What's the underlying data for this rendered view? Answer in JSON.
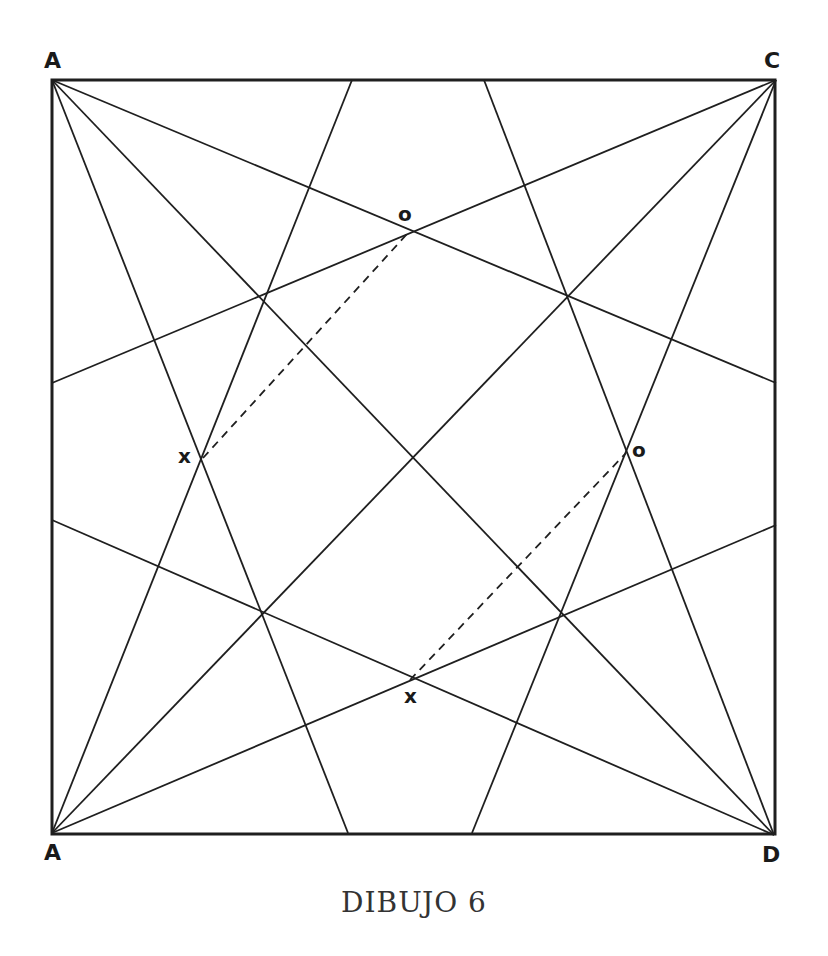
{
  "figure": {
    "caption": "DIBUJO 6",
    "line_color": "#1f1f1f",
    "background": "#ffffff"
  },
  "vertices": {
    "top_left": {
      "label": "A",
      "x": 52,
      "y": 80
    },
    "top_right": {
      "label": "C",
      "x": 776,
      "y": 80
    },
    "bottom_left": {
      "label": "A",
      "x": 52,
      "y": 833
    },
    "bottom_right": {
      "label": "D",
      "x": 774,
      "y": 835
    }
  },
  "points": [
    {
      "label": "o",
      "x": 407,
      "y": 234
    },
    {
      "label": "x",
      "x": 203,
      "y": 458
    },
    {
      "label": "o",
      "x": 626,
      "y": 453
    },
    {
      "label": "x",
      "x": 410,
      "y": 680
    }
  ],
  "lines": [
    {
      "from": [
        52,
        80
      ],
      "to": [
        774,
        835
      ]
    },
    {
      "from": [
        776,
        80
      ],
      "to": [
        52,
        833
      ]
    },
    {
      "from": [
        52,
        80
      ],
      "to": [
        776,
        383
      ]
    },
    {
      "from": [
        52,
        80
      ],
      "to": [
        348,
        833
      ]
    },
    {
      "from": [
        776,
        80
      ],
      "to": [
        52,
        383
      ]
    },
    {
      "from": [
        776,
        80
      ],
      "to": [
        472,
        833
      ]
    },
    {
      "from": [
        52,
        833
      ],
      "to": [
        352,
        80
      ]
    },
    {
      "from": [
        52,
        833
      ],
      "to": [
        776,
        525
      ]
    },
    {
      "from": [
        774,
        835
      ],
      "to": [
        52,
        520
      ]
    },
    {
      "from": [
        774,
        835
      ],
      "to": [
        484,
        80
      ]
    }
  ],
  "dashed_lines": [
    {
      "from": [
        203,
        458
      ],
      "to": [
        407,
        234
      ]
    },
    {
      "from": [
        410,
        680
      ],
      "to": [
        626,
        453
      ]
    }
  ]
}
